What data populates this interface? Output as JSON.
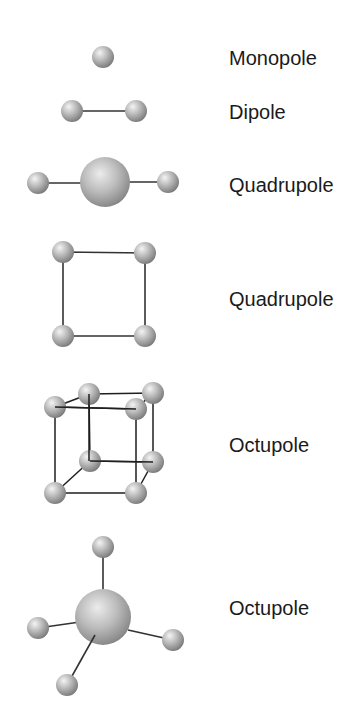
{
  "figure": {
    "sphere_colors": {
      "highlight": "#f2f2f2",
      "mid": "#b8b8b8",
      "shadow": "#7a7a7a",
      "bond": "#333333"
    },
    "rows": [
      {
        "id": "monopole",
        "label": "Monopole",
        "shape": "single sphere"
      },
      {
        "id": "dipole",
        "label": "Dipole",
        "shape": "two spheres joined by a line"
      },
      {
        "id": "quadrupole-linear",
        "label": "Quadrupole",
        "shape": "large central sphere with two small spheres on either side"
      },
      {
        "id": "quadrupole-square",
        "label": "Quadrupole",
        "shape": "four spheres at the corners of a square"
      },
      {
        "id": "octupole-cube",
        "label": "Octupole",
        "shape": "eight spheres at the corners of a cube"
      },
      {
        "id": "octupole-tetrahedral",
        "label": "Octupole",
        "shape": "large central sphere with four small spheres in tetrahedral arrangement"
      }
    ]
  }
}
